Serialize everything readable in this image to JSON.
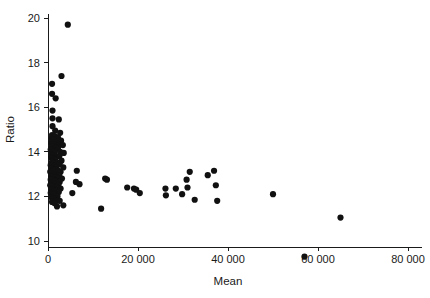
{
  "chart_data": {
    "type": "scatter",
    "title": "",
    "xlabel": "Mean",
    "ylabel": "Ratio",
    "xlim": [
      0,
      80000
    ],
    "ylim": [
      9,
      20.4
    ],
    "grid": false,
    "legend": null,
    "xticks": [
      0,
      20000,
      40000,
      60000,
      80000
    ],
    "xtick_labels": [
      "0",
      "20 000",
      "40 000",
      "60 000",
      "80 000"
    ],
    "yticks": [
      10,
      12,
      14,
      16,
      18,
      20
    ],
    "ytick_labels": [
      "10",
      "12",
      "14",
      "16",
      "18",
      "20"
    ],
    "marker": "filled-circle",
    "marker_color": "#111111",
    "marker_size": 3.1,
    "points": [
      [
        4400,
        19.7
      ],
      [
        3000,
        17.4
      ],
      [
        900,
        17.05
      ],
      [
        900,
        16.6
      ],
      [
        1700,
        16.4
      ],
      [
        1000,
        15.85
      ],
      [
        1000,
        15.5
      ],
      [
        2400,
        15.45
      ],
      [
        1000,
        15.15
      ],
      [
        1600,
        14.95
      ],
      [
        2700,
        14.85
      ],
      [
        900,
        14.75
      ],
      [
        1500,
        14.7
      ],
      [
        2200,
        14.65
      ],
      [
        800,
        14.6
      ],
      [
        1200,
        14.55
      ],
      [
        2900,
        14.5
      ],
      [
        1900,
        14.45
      ],
      [
        700,
        14.4
      ],
      [
        1400,
        14.35
      ],
      [
        2500,
        14.3
      ],
      [
        3300,
        14.3
      ],
      [
        900,
        14.25
      ],
      [
        1700,
        14.2
      ],
      [
        2200,
        14.15
      ],
      [
        600,
        14.1
      ],
      [
        1100,
        14.05
      ],
      [
        1500,
        14.0
      ],
      [
        2700,
        14.0
      ],
      [
        3500,
        13.95
      ],
      [
        800,
        13.9
      ],
      [
        1300,
        13.85
      ],
      [
        2000,
        13.8
      ],
      [
        2500,
        13.8
      ],
      [
        700,
        13.75
      ],
      [
        1100,
        13.7
      ],
      [
        1600,
        13.65
      ],
      [
        3000,
        13.6
      ],
      [
        900,
        13.55
      ],
      [
        1400,
        13.5
      ],
      [
        2100,
        13.5
      ],
      [
        2600,
        13.45
      ],
      [
        600,
        13.4
      ],
      [
        1000,
        13.4
      ],
      [
        1500,
        13.35
      ],
      [
        1900,
        13.3
      ],
      [
        3400,
        13.3
      ],
      [
        800,
        13.25
      ],
      [
        1200,
        13.2
      ],
      [
        1700,
        13.2
      ],
      [
        2300,
        13.15
      ],
      [
        2800,
        13.1
      ],
      [
        500,
        13.1
      ],
      [
        900,
        13.05
      ],
      [
        1300,
        13.0
      ],
      [
        1600,
        13.0
      ],
      [
        2000,
        12.95
      ],
      [
        2500,
        12.95
      ],
      [
        700,
        12.9
      ],
      [
        1100,
        12.9
      ],
      [
        1500,
        12.85
      ],
      [
        1800,
        12.85
      ],
      [
        2200,
        12.8
      ],
      [
        3100,
        12.8
      ],
      [
        600,
        12.75
      ],
      [
        1000,
        12.75
      ],
      [
        1400,
        12.7
      ],
      [
        1700,
        12.7
      ],
      [
        2100,
        12.65
      ],
      [
        2600,
        12.65
      ],
      [
        800,
        12.6
      ],
      [
        1200,
        12.6
      ],
      [
        1500,
        12.55
      ],
      [
        1900,
        12.55
      ],
      [
        2300,
        12.5
      ],
      [
        500,
        12.5
      ],
      [
        900,
        12.45
      ],
      [
        1300,
        12.45
      ],
      [
        1600,
        12.4
      ],
      [
        2000,
        12.4
      ],
      [
        2800,
        12.35
      ],
      [
        700,
        12.3
      ],
      [
        1100,
        12.3
      ],
      [
        1400,
        12.25
      ],
      [
        1800,
        12.25
      ],
      [
        2400,
        12.2
      ],
      [
        600,
        12.15
      ],
      [
        1000,
        12.15
      ],
      [
        1300,
        12.1
      ],
      [
        1700,
        12.05
      ],
      [
        2100,
        12.0
      ],
      [
        800,
        11.95
      ],
      [
        1200,
        11.9
      ],
      [
        1500,
        11.85
      ],
      [
        1900,
        11.8
      ],
      [
        2600,
        11.8
      ],
      [
        900,
        11.75
      ],
      [
        1400,
        11.7
      ],
      [
        3400,
        11.6
      ],
      [
        2000,
        11.55
      ],
      [
        6400,
        13.15
      ],
      [
        6200,
        12.65
      ],
      [
        7000,
        12.55
      ],
      [
        5400,
        12.15
      ],
      [
        12700,
        12.8
      ],
      [
        13100,
        12.75
      ],
      [
        11800,
        11.45
      ],
      [
        17600,
        12.4
      ],
      [
        19100,
        12.35
      ],
      [
        19600,
        12.3
      ],
      [
        20400,
        12.15
      ],
      [
        26100,
        12.35
      ],
      [
        26200,
        12.05
      ],
      [
        28400,
        12.35
      ],
      [
        29800,
        12.1
      ],
      [
        31500,
        13.1
      ],
      [
        30800,
        12.75
      ],
      [
        31000,
        12.4
      ],
      [
        32600,
        11.85
      ],
      [
        35500,
        12.95
      ],
      [
        36900,
        13.15
      ],
      [
        37300,
        12.5
      ],
      [
        37600,
        11.8
      ],
      [
        50000,
        12.1
      ],
      [
        57000,
        9.3
      ],
      [
        65000,
        11.05
      ]
    ]
  }
}
